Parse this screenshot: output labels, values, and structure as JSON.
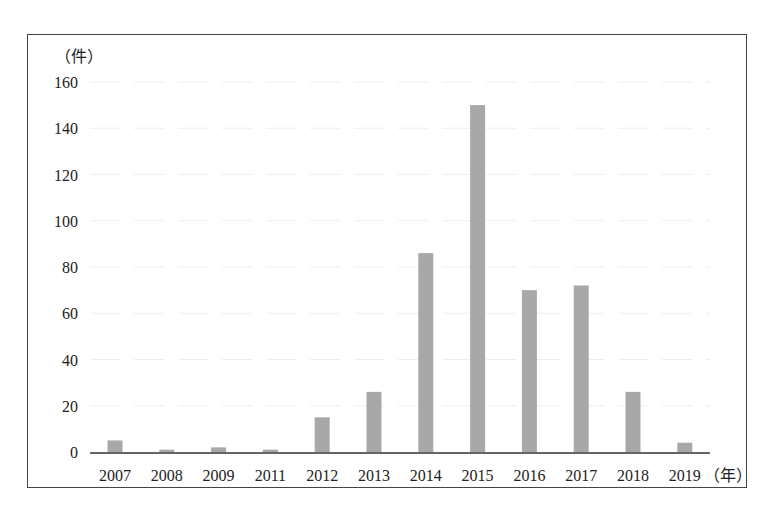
{
  "chart_data": {
    "type": "bar",
    "title": "",
    "xlabel": "（年）",
    "ylabel": "（件）",
    "categories": [
      "2007",
      "2008",
      "2009",
      "2011",
      "2012",
      "2013",
      "2014",
      "2015",
      "2016",
      "2017",
      "2018",
      "2019"
    ],
    "values": [
      5,
      1,
      2,
      1,
      15,
      26,
      86,
      150,
      70,
      72,
      26,
      4
    ],
    "ylim": [
      0,
      160
    ],
    "yticks": [
      0,
      20,
      40,
      60,
      80,
      100,
      120,
      140,
      160
    ],
    "grid": true,
    "legend": "none",
    "colors": {
      "bar": "#a8a8a8",
      "axis": "#333333",
      "grid": "#eeeeee",
      "frame": "#444444"
    }
  }
}
